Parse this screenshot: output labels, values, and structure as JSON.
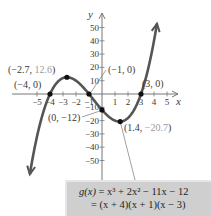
{
  "chart_data": {
    "type": "line",
    "title": "",
    "function": "g(x) = x^3 + 2x^2 - 11x - 12",
    "coefficients": [
      1,
      2,
      -11,
      -12
    ],
    "xlabel": "x",
    "ylabel": "y",
    "xlim": [
      -5.5,
      5.5
    ],
    "ylim": [
      -60,
      60
    ],
    "x_ticks": [
      -5,
      -4,
      -3,
      -2,
      -1,
      1,
      2,
      3,
      4,
      5
    ],
    "y_ticks": [
      50,
      40,
      30,
      20,
      10,
      -10,
      -20,
      -30,
      -40,
      -50
    ],
    "x_tick_labels": [
      "−5",
      "−4",
      "−3",
      "−2",
      "−1",
      "1",
      "2",
      "3",
      "4",
      "5"
    ],
    "y_tick_labels": [
      "50",
      "40",
      "30",
      "20",
      "10",
      "−10",
      "−20",
      "−30",
      "−40",
      "−50"
    ],
    "curve_x_range": [
      -5.55,
      4.23
    ],
    "grid": false,
    "points": [
      {
        "x": -4,
        "y": 0,
        "label_a": "(−4, 0)",
        "kind": "zero"
      },
      {
        "x": -2.7,
        "y": 12.6,
        "label_a": "(−2.7, ",
        "label_b": "12.6",
        "label_c": ")",
        "kind": "relative-max"
      },
      {
        "x": -1,
        "y": 0,
        "label_a": "(−1, 0)",
        "kind": "zero"
      },
      {
        "x": 0,
        "y": -12,
        "label_a": "(0, −12)",
        "kind": "y-intercept"
      },
      {
        "x": 1.4,
        "y": -20.7,
        "label_a": "(1.4, ",
        "label_b": "−20.7",
        "label_c": ")",
        "kind": "relative-min"
      },
      {
        "x": 3,
        "y": 0,
        "label_a": "(3, 0)",
        "kind": "zero"
      }
    ]
  },
  "callout": {
    "line1_lhs": "g(x)",
    "line1_rhs": " = x³ + 2x² − 11x − 12",
    "line2": "= (x + 4)(x + 1)(x − 3)"
  },
  "colors": {
    "curve": "#555555",
    "axis": "#777777",
    "point": "#111111",
    "callout_bg": "#cfcfcf",
    "gray_label": "#9a9a9a"
  }
}
